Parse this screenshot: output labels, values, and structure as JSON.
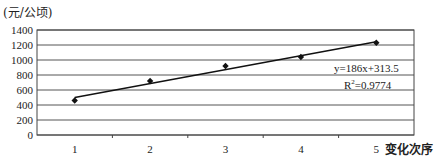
{
  "chart_data": {
    "type": "scatter",
    "title": "",
    "ylabel": "(元/公顷)",
    "xlabel": "变化次序",
    "x": [
      1,
      2,
      3,
      4,
      5
    ],
    "series": [
      {
        "name": "data",
        "values": [
          460,
          720,
          920,
          1040,
          1230
        ],
        "marker": "diamond"
      }
    ],
    "trendline": {
      "type": "linear",
      "slope": 186,
      "intercept": 313.5,
      "r_squared": 0.9774,
      "equation_label": "y=186x+313.5",
      "r2_label": "R²=0.9774"
    },
    "xticks": [
      "1",
      "2",
      "3",
      "4",
      "5"
    ],
    "yticks": [
      "0",
      "200",
      "400",
      "600",
      "800",
      "1000",
      "1200",
      "1400"
    ],
    "ylim": [
      0,
      1400
    ],
    "xlim": [
      0.5,
      5.5
    ],
    "grid": true,
    "legend": "none"
  },
  "labels": {
    "y_unit": "(元/公顷)",
    "x_axis": "变化次序",
    "equation": "y=186x+313.5",
    "r2_prefix": "R",
    "r2_sup": "2",
    "r2_value": "=0.9774"
  }
}
